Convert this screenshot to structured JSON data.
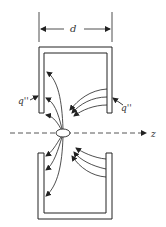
{
  "diagram": {
    "dimension_label": "d",
    "left_flux_label": "q''",
    "right_flux_label": "q''",
    "axis_label": "z",
    "colors": {
      "stroke": "#222222",
      "background": "#ffffff"
    }
  }
}
